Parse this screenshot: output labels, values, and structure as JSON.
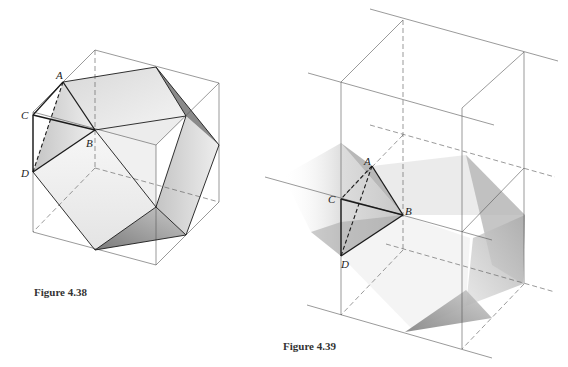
{
  "figures": [
    {
      "id": "fig438",
      "caption": "Figure 4.38",
      "point_labels": {
        "A": "A",
        "B": "B",
        "C": "C",
        "D": "D"
      }
    },
    {
      "id": "fig439",
      "caption": "Figure 4.39",
      "point_labels": {
        "A": "A",
        "B": "B",
        "C": "C",
        "D": "D"
      }
    }
  ]
}
